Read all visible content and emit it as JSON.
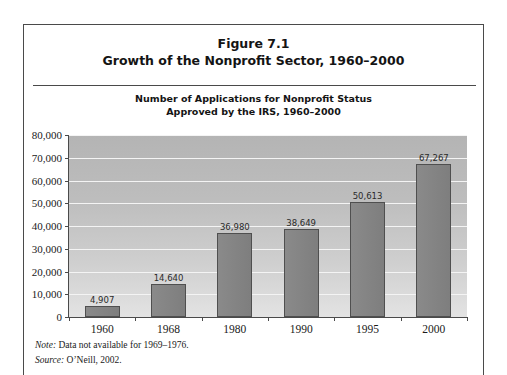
{
  "figure": {
    "title_line1": "Figure 7.1",
    "title_line2": "Growth of the Nonprofit Sector, 1960–2000",
    "subtitle_line1": "Number of Applications for Nonprofit Status",
    "subtitle_line2": "Approved by the IRS, 1960–2000",
    "note_label": "Note:",
    "note_text": " Data not available for 1969–1976.",
    "source_label": "Source:",
    "source_text": " O’Neill, 2002."
  },
  "colors": {
    "bar_fill": "#848484",
    "bar_edge": "#4f4f4f",
    "plot_bg_top": "#b4b4b4",
    "plot_bg_bottom": "#e3e3e3",
    "gridline": "#f4f4f4",
    "axis": "#4a4a4a",
    "frame": "#4a4a4a",
    "text": "#141414"
  },
  "chart_data": {
    "type": "bar",
    "title": "Number of Applications for Nonprofit Status Approved by the IRS, 1960–2000",
    "xlabel": "",
    "ylabel": "",
    "categories": [
      "1960",
      "1968",
      "1980",
      "1990",
      "1995",
      "2000"
    ],
    "values": [
      4907,
      14640,
      36980,
      38649,
      50613,
      67267
    ],
    "value_labels": [
      "4,907",
      "14,640",
      "36,980",
      "38,649",
      "50,613",
      "67,267"
    ],
    "ylim": [
      0,
      80000
    ],
    "ytick_values": [
      0,
      10000,
      20000,
      30000,
      40000,
      50000,
      60000,
      70000,
      80000
    ],
    "ytick_labels": [
      "0",
      "10,000",
      "20,000",
      "30,000",
      "40,000",
      "50,000",
      "60,000",
      "70,000",
      "80,000"
    ],
    "grid": "horizontal",
    "legend": "none"
  }
}
